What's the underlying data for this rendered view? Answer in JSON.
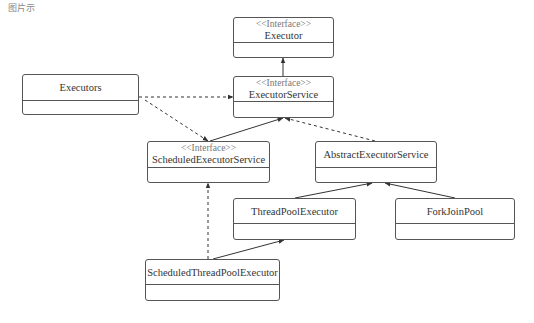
{
  "caption": "图片示",
  "colors": {
    "line": "#333333",
    "box_border": "#555555",
    "stereotype": "#777777"
  },
  "classes": [
    {
      "id": "executor",
      "stereotype": "<<Interface>>",
      "name": "Executor",
      "x": 233,
      "y": 17,
      "w": 101,
      "h": 41,
      "head": 25
    },
    {
      "id": "executor-service",
      "stereotype": "<<Interface>>",
      "name": "ExecutorService",
      "x": 233,
      "y": 76,
      "w": 101,
      "h": 42,
      "head": 25
    },
    {
      "id": "executors",
      "stereotype": "",
      "name": "Executors",
      "x": 22,
      "y": 74,
      "w": 117,
      "h": 41,
      "head": 26
    },
    {
      "id": "scheduled-executor-service",
      "stereotype": "<<Interface>>",
      "name": "ScheduledExecutorService",
      "x": 147,
      "y": 141,
      "w": 123,
      "h": 42,
      "head": 26
    },
    {
      "id": "abstract-executor-service",
      "stereotype": "",
      "name": "AbstractExecutorService",
      "x": 315,
      "y": 141,
      "w": 122,
      "h": 42,
      "head": 26
    },
    {
      "id": "thread-pool-executor",
      "stereotype": "",
      "name": "ThreadPoolExecutor",
      "x": 233,
      "y": 198,
      "w": 123,
      "h": 42,
      "head": 25
    },
    {
      "id": "fork-join-pool",
      "stereotype": "",
      "name": "ForkJoinPool",
      "x": 395,
      "y": 198,
      "w": 120,
      "h": 42,
      "head": 25
    },
    {
      "id": "scheduled-thread-pool-executor",
      "stereotype": "",
      "name": "ScheduledThreadPoolExecutor",
      "x": 145,
      "y": 259,
      "w": 135,
      "h": 42,
      "head": 25
    }
  ],
  "relations": [
    {
      "from": "executor-service",
      "to": "executor",
      "type": "extends",
      "style": "solid"
    },
    {
      "from": "executors",
      "to": "executor-service",
      "type": "dependency",
      "style": "dashed"
    },
    {
      "from": "executors",
      "to": "scheduled-executor-service",
      "type": "dependency",
      "style": "dashed"
    },
    {
      "from": "scheduled-executor-service",
      "to": "executor-service",
      "type": "extends",
      "style": "solid"
    },
    {
      "from": "abstract-executor-service",
      "to": "executor-service",
      "type": "implements",
      "style": "dashed"
    },
    {
      "from": "thread-pool-executor",
      "to": "abstract-executor-service",
      "type": "extends",
      "style": "solid"
    },
    {
      "from": "fork-join-pool",
      "to": "abstract-executor-service",
      "type": "extends",
      "style": "solid"
    },
    {
      "from": "scheduled-thread-pool-executor",
      "to": "thread-pool-executor",
      "type": "extends",
      "style": "solid"
    },
    {
      "from": "scheduled-thread-pool-executor",
      "to": "scheduled-executor-service",
      "type": "implements",
      "style": "dashed"
    }
  ]
}
